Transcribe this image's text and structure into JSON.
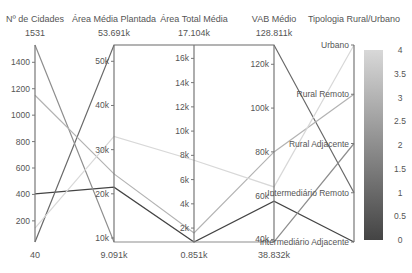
{
  "chart_data": {
    "type": "parallel_coordinates",
    "title": "",
    "dimensions": [
      {
        "label": "Nº de Cidades",
        "max_label": "1531",
        "min_label": "40",
        "range": [
          40,
          1531
        ],
        "ticks": [
          200,
          400,
          600,
          800,
          1000,
          1200,
          1400
        ],
        "tick_labels": [
          "200",
          "400",
          "600",
          "800",
          "1000",
          "1200",
          "1400"
        ]
      },
      {
        "label": "Área Média Plantada",
        "max_label": "53.691k",
        "min_label": "9.091k",
        "range": [
          9091,
          53691
        ],
        "ticks": [
          10000,
          20000,
          30000,
          40000,
          50000
        ],
        "tick_labels": [
          "10k",
          "20k",
          "30k",
          "40k",
          "50k"
        ]
      },
      {
        "label": "Área Total Média",
        "max_label": "17.104k",
        "min_label": "0.851k",
        "range": [
          851,
          17104
        ],
        "ticks": [
          2000,
          4000,
          6000,
          8000,
          10000,
          12000,
          14000,
          16000
        ],
        "tick_labels": [
          "2k",
          "4k",
          "6k",
          "8k",
          "10k",
          "12k",
          "14k",
          "16k"
        ]
      },
      {
        "label": "VAB Médio",
        "max_label": "128.811k",
        "min_label": "38.832k",
        "range": [
          38832,
          128811
        ],
        "ticks": [
          40000,
          60000,
          80000,
          100000,
          120000
        ],
        "tick_labels": [
          "40k",
          "60k",
          "80k",
          "100k",
          "120k"
        ]
      },
      {
        "label": "Tipologia Rural/Urbano",
        "categorical": true,
        "categories": [
          "Intermediário Adjacente",
          "Intermediário Remoto",
          "Rural Adjacente",
          "Rural Remoto",
          "Urbano"
        ]
      }
    ],
    "series": [
      {
        "name": "Intermediário Adjacente",
        "color_value": 0,
        "values": [
          405,
          21500,
          851,
          57500,
          0
        ]
      },
      {
        "name": "Intermediário Remoto",
        "color_value": 1,
        "values": [
          40,
          53691,
          17104,
          128811,
          1
        ]
      },
      {
        "name": "Rural Adjacente",
        "color_value": 2,
        "values": [
          1531,
          9091,
          851,
          38832,
          2
        ]
      },
      {
        "name": "Rural Remoto",
        "color_value": 3,
        "values": [
          1150,
          24500,
          1600,
          80000,
          3
        ]
      },
      {
        "name": "Urbano",
        "color_value": 4,
        "values": [
          145,
          33000,
          7600,
          64000,
          4
        ]
      }
    ],
    "colorbar": {
      "range": [
        0,
        4
      ],
      "ticks": [
        0,
        0.5,
        1,
        1.5,
        2,
        2.5,
        3,
        3.5,
        4
      ],
      "tick_labels": [
        "0",
        "0.5",
        "1",
        "1.5",
        "2",
        "2.5",
        "3",
        "3.5",
        "4"
      ],
      "color_low": "#444444",
      "color_high": "#d8d8d8"
    }
  }
}
